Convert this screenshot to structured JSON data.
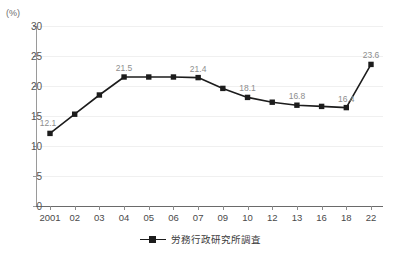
{
  "chart_data": {
    "type": "line",
    "title": "",
    "subtitle": "",
    "xlabel": "",
    "ylabel": "",
    "y_unit": "(%)",
    "ylim": [
      0,
      30
    ],
    "yticks": [
      0,
      5,
      10,
      15,
      20,
      25,
      30
    ],
    "grid": true,
    "legend_position": "bottom-center",
    "categories": [
      "2001",
      "02",
      "03",
      "04",
      "05",
      "06",
      "07",
      "09",
      "10",
      "12",
      "13",
      "16",
      "18",
      "22"
    ],
    "series": [
      {
        "name": "労務行政研究所調査",
        "color": "#1c1c1c",
        "marker": "square",
        "values": [
          12.1,
          15.3,
          18.5,
          21.5,
          21.5,
          21.5,
          21.4,
          19.6,
          18.1,
          17.3,
          16.8,
          16.6,
          16.4,
          23.6
        ],
        "point_labels": [
          "12.1",
          "",
          "",
          "21.5",
          "",
          "",
          "21.4",
          "",
          "18.1",
          "",
          "16.8",
          "",
          "16.4",
          "23.6"
        ]
      }
    ]
  },
  "legend": {
    "series_label": "労務行政研究所調査"
  }
}
